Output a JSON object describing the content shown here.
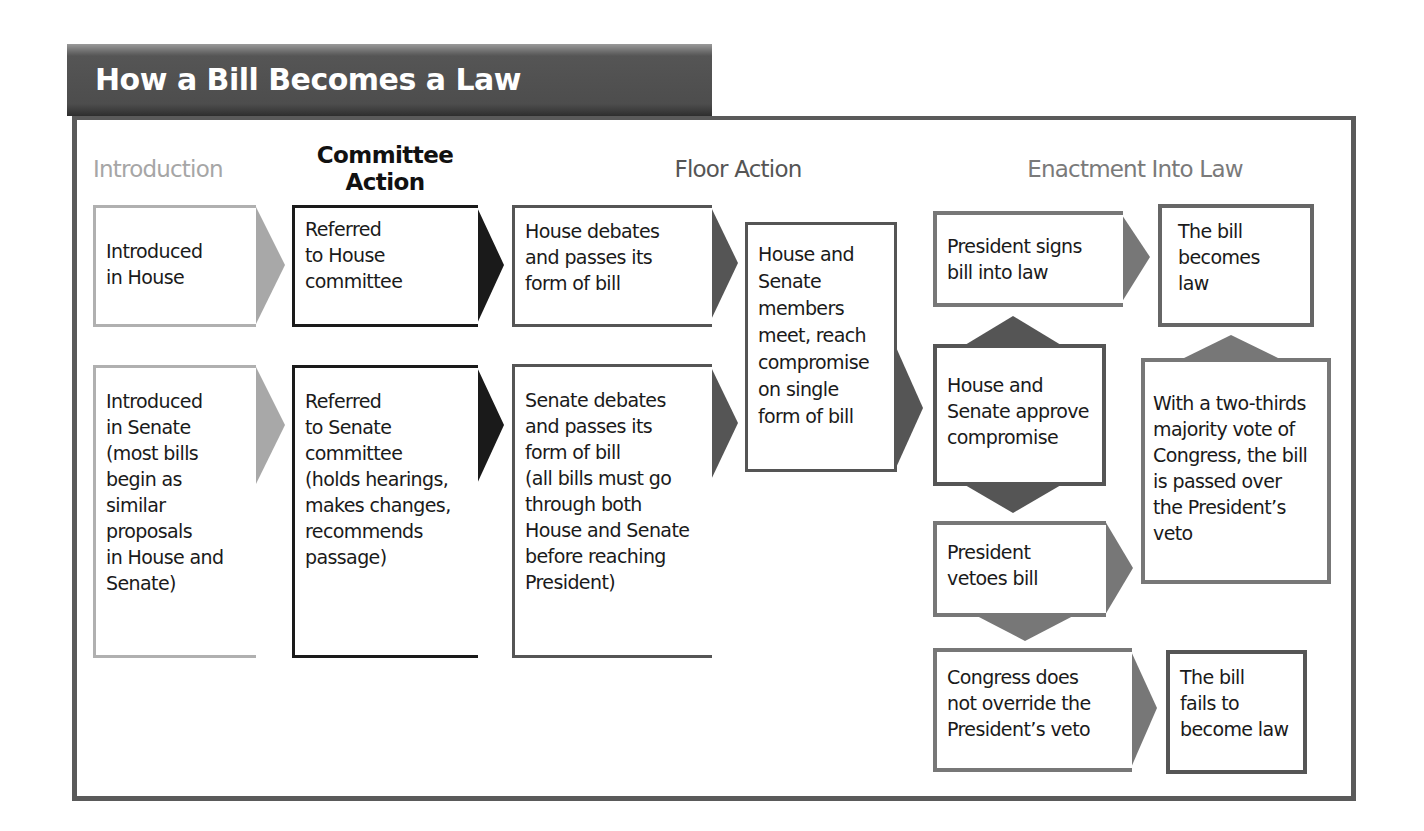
{
  "title": "How a Bill Becomes a Law",
  "colors": {
    "banner": "#4d4d4d",
    "frame": "#5a5a5a",
    "intro_light": "#a8a8a8",
    "committee_dark": "#1a1a1a",
    "floor_mid": "#555555",
    "enact_mid": "#707070",
    "text": "#1a1a1a"
  },
  "stages": {
    "introduction": "Introduction",
    "committee": "Committee\nAction",
    "floor": "Floor Action",
    "enactment": "Enactment Into Law"
  },
  "boxes": {
    "intro_house": "Introduced\nin House",
    "intro_senate": "Introduced\nin Senate\n(most bills\nbegin as\nsimilar\nproposals\nin House and\nSenate)",
    "committee_house": "Referred\nto House\ncommittee",
    "committee_senate": "Referred\nto Senate\ncommittee\n(holds hearings,\nmakes changes,\nrecommends\npassage)",
    "floor_house": "House debates\nand passes its\nform of bill",
    "floor_senate": "Senate debates\nand passes its\nform of bill\n(all bills must go\nthrough both\nHouse and Senate\nbefore reaching\nPresident)",
    "conference": "House and\nSenate\nmembers\nmeet, reach\ncompromise\non single\nform of bill",
    "president_signs": "President signs\nbill into law",
    "approve_compromise": "House and\nSenate approve\ncompromise",
    "president_vetoes": "President\nvetoes bill",
    "no_override": "Congress does\nnot override the\nPresident’s veto",
    "becomes_law": "The bill\nbecomes\nlaw",
    "override": "With a two-thirds\nmajority vote of\nCongress, the bill\nis passed over\nthe President’s\nveto",
    "fails": "The bill\nfails to\nbecome law"
  }
}
